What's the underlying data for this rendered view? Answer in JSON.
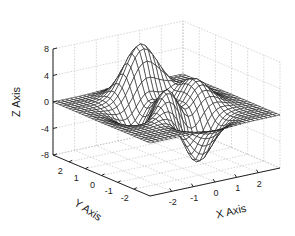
{
  "chart_data": {
    "type": "surface",
    "function": "peaks",
    "title": "",
    "xlabel": "X Axis",
    "ylabel": "Y Axis",
    "zlabel": "Z Axis",
    "xlim": [
      -3,
      3
    ],
    "ylim": [
      -3,
      3
    ],
    "zlim": [
      -8,
      8
    ],
    "xticks": [
      -2,
      -1,
      0,
      1,
      2
    ],
    "yticks": [
      -2,
      -1,
      0,
      1,
      2
    ],
    "zticks": [
      -8,
      -4,
      0,
      4,
      8
    ],
    "xtick_labels": [
      "-2",
      "-1",
      "0",
      "1",
      "2"
    ],
    "ytick_labels": [
      "-2",
      "-1",
      "0",
      "1",
      "2"
    ],
    "ztick_labels": [
      "-8",
      "-4",
      "0",
      "4",
      "8"
    ],
    "grid": true,
    "mesh_resolution": 31,
    "face_color": "#ffffff",
    "edge_color": "#111111",
    "peaks": [
      {
        "x": 0.0,
        "y": 1.6,
        "z": 8.1
      },
      {
        "x": -0.5,
        "y": -0.6,
        "z": 3.8
      },
      {
        "x": 0.2,
        "y": -1.6,
        "z": -6.5
      },
      {
        "x": -1.35,
        "y": 0.2,
        "z": 3.6
      }
    ]
  },
  "colors": {
    "background": "#ffffff",
    "axis": "#222222",
    "grid": "#b8b8b8",
    "mesh": "#111111"
  }
}
